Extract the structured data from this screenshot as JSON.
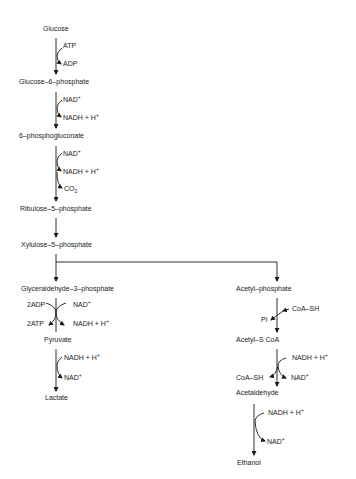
{
  "diagram": {
    "type": "metabolic-pathway",
    "metabolites": {
      "glucose": "Glucose",
      "g6p": "Glucose–6–phosphate",
      "pg6": "6–phosphogluconate",
      "ru5p": "Ribulose–5–phosphate",
      "xu5p": "Xylulose–5–phosphate",
      "gap": "Glyceraldehyde–3–phosphate",
      "pyruvate": "Pyruvate",
      "lactate": "Lactate",
      "acetylp": "Acetyl–phosphate",
      "acetylcoa": "Acetyl–S CoA",
      "acetaldehyde": "Acetaldehyde",
      "ethanol": "Ethanol"
    },
    "cofactors": {
      "s1_in": "ATP",
      "s1_out": "ADP",
      "s2_in": "NAD",
      "s2_in_sup": "+",
      "s2_out": "NADH + H",
      "s2_out_sup": "+",
      "s3_in": "NAD",
      "s3_in_sup": "+",
      "s3_out": "NADH + H",
      "s3_out_sup": "+",
      "s3_out2": "CO",
      "s3_out2_sub": "2",
      "s4_in_left": "2ADP",
      "s4_out_left": "2ATP",
      "s4_in_right": "NAD",
      "s4_in_right_sup": "+",
      "s4_out_right": "NADH + H",
      "s4_out_right_sup": "+",
      "s5_in": "NADH + H",
      "s5_in_sup": "+",
      "s5_out": "NAD",
      "s5_out_sup": "+",
      "s6_in": "CoA–SH",
      "s6_out": "Pi",
      "s7_in": "NADH + H",
      "s7_in_sup": "+",
      "s7_out_left": "CoA–SH",
      "s7_out_right": "NAD",
      "s7_out_right_sup": "+",
      "s8_in": "NADH + H",
      "s8_in_sup": "+",
      "s8_out": "NAD",
      "s8_out_sup": "+"
    },
    "colors": {
      "ink": "#1a1a1a",
      "background": "#ffffff"
    }
  }
}
